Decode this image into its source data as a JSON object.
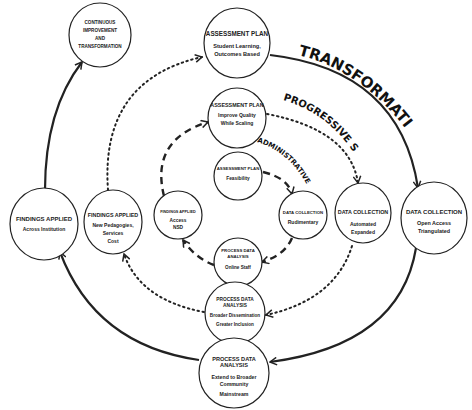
{
  "stages": {
    "transformative": "TRANSFORMATIVE STAGE",
    "progressive": "PROGRESSIVE STAGE",
    "administrative": "ADMINISTRATIVE STAGE"
  },
  "nodes": {
    "continuous": {
      "lines": [
        "CONTINUOUS",
        "IMPROVEMENT",
        "AND",
        "TRANSFORMATION"
      ]
    },
    "ap_outer": {
      "title": "ASSESSMENT PLAN",
      "lines": [
        "Student Learning,",
        "Outcomes Based"
      ]
    },
    "ap_middle": {
      "title": "ASSESSMENT PLAN",
      "lines": [
        "Improve Quality",
        "While Scaling"
      ]
    },
    "ap_inner": {
      "title": "ASSESSMENT PLAN",
      "lines": [
        "Feasibility"
      ]
    },
    "dc_inner": {
      "title": "DATA COLLECTION",
      "lines": [
        "Rudimentary"
      ]
    },
    "dc_middle": {
      "title": "DATA COLLECTION",
      "lines": [
        "Automated",
        "Expanded"
      ]
    },
    "dc_outer": {
      "title": "DATA COLLECTION",
      "lines": [
        "Open Access",
        "Triangulated"
      ]
    },
    "pda_inner": {
      "title1": "PROCESS DATA",
      "title2": "ANALYSIS",
      "lines": [
        "Online Staff"
      ]
    },
    "pda_middle": {
      "title1": "PROCESS DATA",
      "title2": "ANALYSIS",
      "lines": [
        "Broader Dissemination",
        "Greater Inclusion"
      ]
    },
    "pda_outer": {
      "title1": "PROCESS DATA",
      "title2": "ANALYSIS",
      "lines": [
        "Extend to Broader",
        "Community",
        "Mainstream"
      ]
    },
    "fa_inner": {
      "title": "FINDINGS APPLIED",
      "lines": [
        "Access",
        "NSD"
      ]
    },
    "fa_middle": {
      "title": "FINDINGS APPLIED",
      "lines": [
        "New Pedagogies,",
        "Services",
        "Cost"
      ]
    },
    "fa_outer": {
      "title": "FINDINGS APPLIED",
      "lines": [
        "Across Institution"
      ]
    }
  },
  "colors": {
    "stroke": "#222222",
    "text": "#222222",
    "background": "#ffffff"
  }
}
